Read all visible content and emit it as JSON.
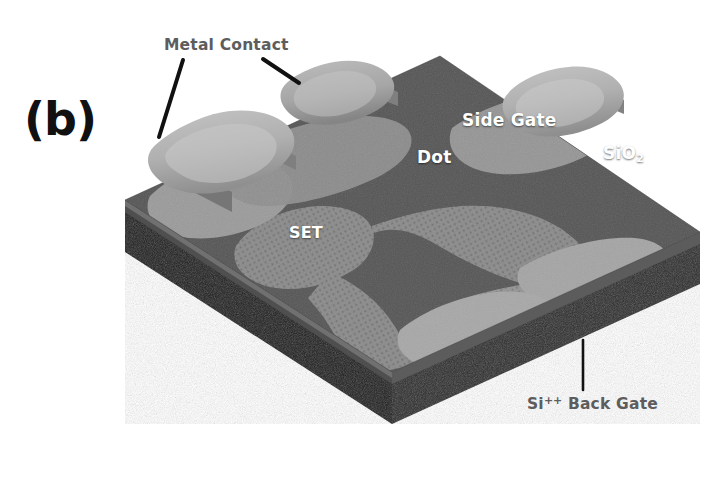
{
  "figure": {
    "panel_label": "(b)",
    "background_color": "#ffffff"
  },
  "surface_labels": [
    {
      "id": "side-gate",
      "text": "Side Gate",
      "color": "#ffffff"
    },
    {
      "id": "dot",
      "text": "Dot",
      "color": "#ffffff"
    },
    {
      "id": "sio2",
      "text": "SiO",
      "subscript": "2",
      "color": "#ffffff"
    },
    {
      "id": "set",
      "text": "SET",
      "color": "#ffffff"
    }
  ],
  "callouts": [
    {
      "id": "metal-contact",
      "text": "Metal Contact",
      "color": "#5d5d5d",
      "leader_count": 2
    },
    {
      "id": "back-gate",
      "prefix": "Si",
      "superscript": "++",
      "text": "Back Gate",
      "color": "#5d5d5d",
      "leader_count": 1
    }
  ],
  "colors": {
    "substrate_dark": "#232323",
    "substrate_edge": "#3a3a3a",
    "oxide_top": "#555555",
    "oxide_side": "#454545",
    "electrode_light": "#9a9a9a",
    "electrode_mid": "#7d7d7d",
    "metal_pad": "#b3b3b3",
    "metal_pad_shadow": "#8e8e8e",
    "leader_line": "#111111",
    "label_gray": "#5d5d5d",
    "label_white": "#ffffff"
  },
  "structure": {
    "type": "3d-isometric-slab",
    "description": "Single-electron transistor device schematic",
    "layers": [
      "Si++ Back Gate substrate",
      "SiO2 oxide",
      "patterned electrodes",
      "metal contact pads"
    ],
    "top_face_vertices": "left(125,200) back(440,56) right(700,232) front(392,372)",
    "slab_thickness_px": 52
  }
}
